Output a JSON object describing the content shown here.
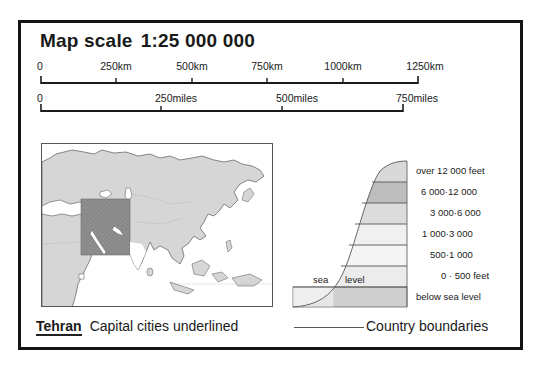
{
  "title": {
    "label": "Map scale",
    "scale": "1:25 000 000"
  },
  "scale_bars": {
    "km": {
      "unit": "km",
      "ticks": [
        {
          "label": "0",
          "x": 41
        },
        {
          "label": "250km",
          "x": 116
        },
        {
          "label": "500km",
          "x": 192
        },
        {
          "label": "750km",
          "x": 267
        },
        {
          "label": "1000km",
          "x": 343
        },
        {
          "label": "1250km",
          "x": 418
        }
      ]
    },
    "miles": {
      "unit": "miles",
      "ticks": [
        {
          "label": "0",
          "x": 41
        },
        {
          "label": "250miles",
          "x": 161
        },
        {
          "label": "500miles",
          "x": 282
        },
        {
          "label": "750miles",
          "x": 403
        }
      ]
    }
  },
  "locator_map": {
    "region": "Asia",
    "highlighted_area": "Middle East",
    "colors": {
      "land": "#d6d6d6",
      "sea": "#ffffff",
      "highlight": "#8e8e8e",
      "outline": "#666666"
    }
  },
  "elevation_key": {
    "bands": [
      {
        "label": "over 12 000 feet",
        "color": "#d9d9d9"
      },
      {
        "label": "6 000·12 000",
        "color": "#bdbdbd"
      },
      {
        "label": "3 000·6 000",
        "color": "#dcdcdc"
      },
      {
        "label": "1 000·3 000",
        "color": "#f0f0f0"
      },
      {
        "label": "500·1 000",
        "color": "#f5f5f5"
      },
      {
        "label": "0 · 500 feet",
        "color": "#ececec"
      },
      {
        "label": "below sea level",
        "color": "#cfcfcf"
      }
    ],
    "sea_level_text_1": "sea",
    "sea_level_text_2": "level"
  },
  "legend": {
    "capital_example": "Tehran",
    "capital_text": "Capital cities underlined",
    "boundary_text": "Country boundaries"
  }
}
